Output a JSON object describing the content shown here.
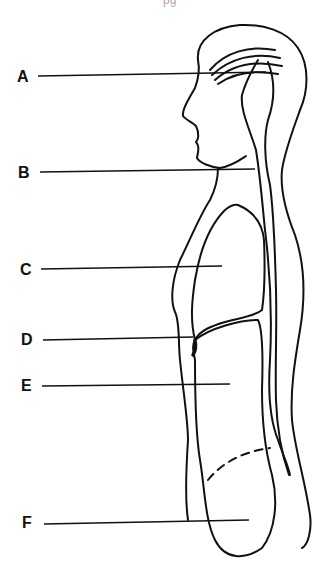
{
  "top_fragment": "pg",
  "labels": [
    {
      "letter": "A",
      "x": 17,
      "y": 69,
      "line_end_x": 266,
      "line_y": 74
    },
    {
      "letter": "B",
      "x": 18,
      "y": 165,
      "line_end_x": 255,
      "line_y": 170
    },
    {
      "letter": "C",
      "x": 20,
      "y": 262,
      "line_end_x": 222,
      "line_y": 267
    },
    {
      "letter": "D",
      "x": 21,
      "y": 332,
      "line_end_x": 193,
      "line_y": 338
    },
    {
      "letter": "E",
      "x": 21,
      "y": 380,
      "line_end_x": 230,
      "line_y": 384
    },
    {
      "letter": "F",
      "x": 22,
      "y": 515,
      "line_end_x": 249,
      "line_y": 520
    }
  ]
}
